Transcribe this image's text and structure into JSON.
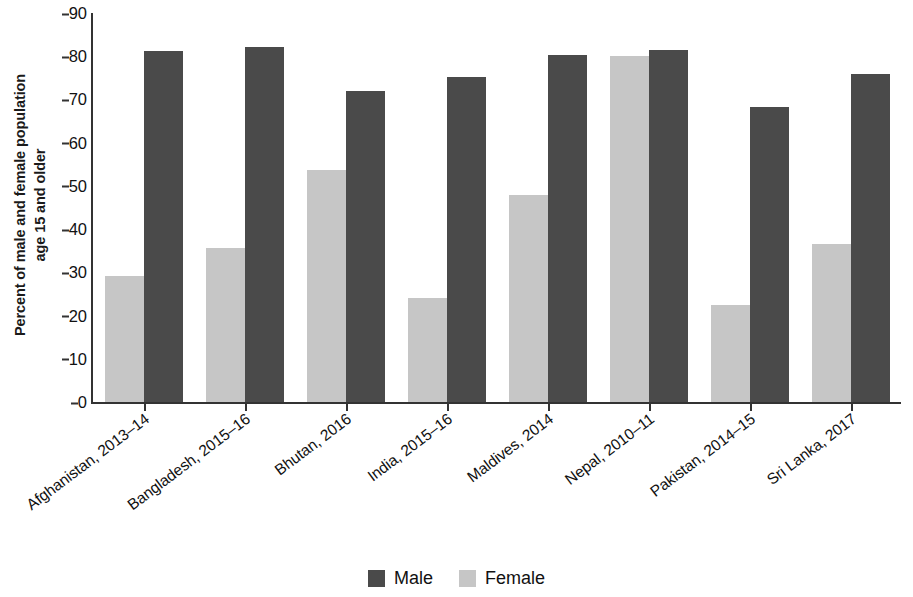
{
  "chart_data": {
    "type": "bar",
    "title": "",
    "xlabel": "",
    "ylabel": "Percent of male and female population age 15 and older",
    "ylabel_lines": [
      "Percent of male and female population",
      "age 15 and older"
    ],
    "ylim": [
      0,
      90
    ],
    "ytick_step": 10,
    "yticks": [
      90,
      80,
      70,
      60,
      50,
      40,
      30,
      20,
      10,
      0
    ],
    "grid": false,
    "legend_position": "bottom-center",
    "categories": [
      "Afghanistan, 2013–14",
      "Bangladesh, 2015–16",
      "Bhutan, 2016",
      "India, 2015–16",
      "Maldives, 2014",
      "Nepal, 2010–11",
      "Pakistan, 2014–15",
      "Sri Lanka, 2017"
    ],
    "series": [
      {
        "name": "Female",
        "color": "#c6c6c6",
        "values": [
          29.2,
          35.6,
          53.7,
          24.1,
          47.8,
          80.1,
          22.5,
          36.6
        ]
      },
      {
        "name": "Male",
        "color": "#4a4a4a",
        "values": [
          81.1,
          82.1,
          71.9,
          75.3,
          80.2,
          81.4,
          68.3,
          75.8
        ]
      }
    ],
    "series_draw_order": [
      "Female",
      "Male"
    ]
  },
  "legend": {
    "items": [
      {
        "label": "Male",
        "swatch": "male"
      },
      {
        "label": "Female",
        "swatch": "female"
      }
    ]
  },
  "colors": {
    "male": "#4a4a4a",
    "female": "#c6c6c6",
    "axis": "#333333",
    "text": "#111111",
    "background": "#ffffff"
  }
}
